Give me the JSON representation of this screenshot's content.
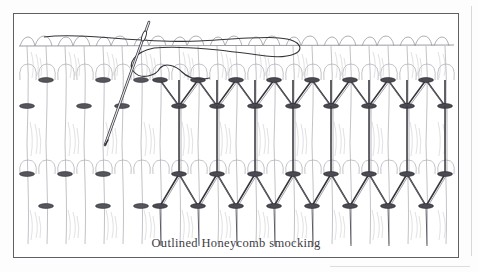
{
  "figure": {
    "caption": "Outlined Honeycomb smocking",
    "technique": "Outlined Honeycomb smocking",
    "frame": {
      "border_color": "#5f5f66",
      "background_color": "#ffffff",
      "x": 13,
      "y": 13,
      "width": 446,
      "height": 245
    },
    "page_background_color": "#fdfdfd",
    "colors": {
      "stitch_thread": "#2f2f35",
      "fabric_line": "#9a9aa2",
      "fabric_shading": "#b9b9c0",
      "needle_outline": "#3a3a40",
      "caption_text": "#3d3d44",
      "page_edge": "#d8d8dc"
    },
    "elements": [
      {
        "name": "fabric-pleats",
        "label": "gathered fabric pleats"
      },
      {
        "name": "gathering-rows",
        "label": "rows of gathering stitches"
      },
      {
        "name": "honeycomb-upper-row",
        "label": "upper outlined honeycomb row"
      },
      {
        "name": "honeycomb-lower-row",
        "label": "lower outlined honeycomb row"
      },
      {
        "name": "needle",
        "label": "threaded embroidery needle"
      },
      {
        "name": "working-thread",
        "label": "working thread loop"
      }
    ],
    "geometry": {
      "fabric_top_y": 45,
      "pleat_count": 23,
      "pleat_start_x": 18,
      "pleat_pitch": 19.0,
      "row_upper_top_y": 78,
      "row_upper_bottom_y": 104,
      "row_lower_top_y": 172,
      "row_lower_bottom_y": 205,
      "stitched_start_x": 152,
      "stitched_end_x": 430,
      "gathering_rows_y": [
        78,
        104,
        172,
        205
      ]
    },
    "needle": {
      "tip_x": 108,
      "tip_y": 145,
      "head_x": 152,
      "head_y": 20,
      "eye_center_x": 147,
      "eye_center_y": 33
    }
  }
}
